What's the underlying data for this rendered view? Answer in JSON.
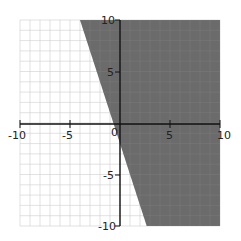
{
  "chart_data": {
    "type": "area",
    "title": "",
    "xlabel": "",
    "ylabel": "",
    "xlim": [
      -10,
      10
    ],
    "ylim": [
      -10,
      10
    ],
    "grid": true,
    "grid_step": 1,
    "boundary_line": {
      "equation": "y = -3x - 2",
      "points": [
        [
          -4,
          10
        ],
        [
          2.67,
          -10
        ]
      ],
      "style": "solid"
    },
    "shaded_region": "y >= -3x - 2",
    "shade_color": "#6b6b6b",
    "x_tick_labels": [
      "-10",
      "-5",
      "0",
      "5",
      "10"
    ],
    "y_tick_labels": [
      "10",
      "5",
      "-5",
      "-10"
    ]
  }
}
